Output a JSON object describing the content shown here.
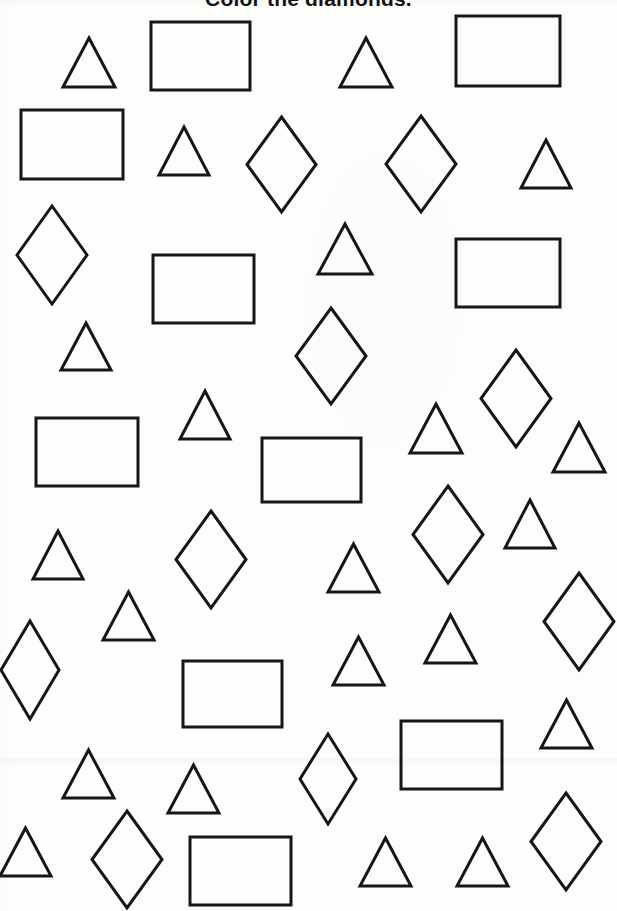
{
  "worksheet": {
    "title": "Color the diamonds.",
    "title_clipped_at_top": true,
    "instruction_target_shape": "diamond",
    "background_color": "#fdfdfc",
    "stroke_color": "#15161a",
    "page_width": 617,
    "page_height": 911,
    "counts": {
      "triangles": 25,
      "rectangles": 11,
      "diamonds": 16,
      "total": 52
    }
  },
  "shapes": [
    {
      "name": "triangle-1",
      "type": "triangle",
      "x": 63,
      "y": 38,
      "w": 52,
      "h": 49,
      "stroke": 3.0
    },
    {
      "name": "rectangle-1",
      "type": "rectangle",
      "x": 151,
      "y": 22,
      "w": 99,
      "h": 68,
      "stroke": 3.0
    },
    {
      "name": "triangle-2",
      "type": "triangle",
      "x": 340,
      "y": 38,
      "w": 52,
      "h": 49,
      "stroke": 3.0
    },
    {
      "name": "rectangle-2",
      "type": "rectangle",
      "x": 456,
      "y": 16,
      "w": 104,
      "h": 70,
      "stroke": 3.0
    },
    {
      "name": "rectangle-3",
      "type": "rectangle",
      "x": 21,
      "y": 110,
      "w": 102,
      "h": 69,
      "stroke": 3.0
    },
    {
      "name": "triangle-3",
      "type": "triangle",
      "x": 159,
      "y": 127,
      "w": 50,
      "h": 48,
      "stroke": 3.0
    },
    {
      "name": "diamond-1",
      "type": "diamond",
      "x": 247,
      "y": 117,
      "w": 69,
      "h": 95,
      "stroke": 3.0
    },
    {
      "name": "diamond-2",
      "type": "diamond",
      "x": 386,
      "y": 116,
      "w": 70,
      "h": 96,
      "stroke": 3.0
    },
    {
      "name": "triangle-4",
      "type": "triangle",
      "x": 521,
      "y": 140,
      "w": 50,
      "h": 48,
      "stroke": 3.0
    },
    {
      "name": "diamond-3",
      "type": "diamond",
      "x": 17,
      "y": 206,
      "w": 70,
      "h": 98,
      "stroke": 3.0
    },
    {
      "name": "triangle-5",
      "type": "triangle",
      "x": 318,
      "y": 224,
      "w": 54,
      "h": 50,
      "stroke": 3.0
    },
    {
      "name": "rectangle-4",
      "type": "rectangle",
      "x": 153,
      "y": 255,
      "w": 101,
      "h": 68,
      "stroke": 3.0
    },
    {
      "name": "rectangle-5",
      "type": "rectangle",
      "x": 456,
      "y": 239,
      "w": 104,
      "h": 68,
      "stroke": 3.0
    },
    {
      "name": "triangle-6",
      "type": "triangle",
      "x": 61,
      "y": 323,
      "w": 50,
      "h": 47,
      "stroke": 3.0
    },
    {
      "name": "diamond-4",
      "type": "diamond",
      "x": 296,
      "y": 308,
      "w": 70,
      "h": 96,
      "stroke": 3.0
    },
    {
      "name": "diamond-5",
      "type": "diamond",
      "x": 481,
      "y": 350,
      "w": 70,
      "h": 97,
      "stroke": 3.0
    },
    {
      "name": "triangle-7",
      "type": "triangle",
      "x": 180,
      "y": 391,
      "w": 50,
      "h": 48,
      "stroke": 3.0
    },
    {
      "name": "triangle-8",
      "type": "triangle",
      "x": 410,
      "y": 404,
      "w": 52,
      "h": 49,
      "stroke": 3.0
    },
    {
      "name": "rectangle-6",
      "type": "rectangle",
      "x": 36,
      "y": 418,
      "w": 102,
      "h": 68,
      "stroke": 3.0
    },
    {
      "name": "triangle-9",
      "type": "triangle",
      "x": 553,
      "y": 423,
      "w": 52,
      "h": 49,
      "stroke": 3.0
    },
    {
      "name": "rectangle-7",
      "type": "rectangle",
      "x": 262,
      "y": 438,
      "w": 99,
      "h": 64,
      "stroke": 3.0
    },
    {
      "name": "diamond-6",
      "type": "diamond",
      "x": 176,
      "y": 511,
      "w": 70,
      "h": 97,
      "stroke": 3.0
    },
    {
      "name": "diamond-7",
      "type": "diamond",
      "x": 413,
      "y": 486,
      "w": 70,
      "h": 97,
      "stroke": 3.0
    },
    {
      "name": "triangle-10",
      "type": "triangle",
      "x": 505,
      "y": 500,
      "w": 50,
      "h": 48,
      "stroke": 3.0
    },
    {
      "name": "triangle-11",
      "type": "triangle",
      "x": 33,
      "y": 531,
      "w": 50,
      "h": 48,
      "stroke": 3.0
    },
    {
      "name": "triangle-12",
      "type": "triangle",
      "x": 328,
      "y": 544,
      "w": 51,
      "h": 48,
      "stroke": 3.0
    },
    {
      "name": "diamond-8",
      "type": "diamond",
      "x": 544,
      "y": 573,
      "w": 70,
      "h": 97,
      "stroke": 3.0
    },
    {
      "name": "triangle-13",
      "type": "triangle",
      "x": 103,
      "y": 592,
      "w": 51,
      "h": 48,
      "stroke": 3.0
    },
    {
      "name": "triangle-14",
      "type": "triangle",
      "x": 425,
      "y": 615,
      "w": 51,
      "h": 48,
      "stroke": 3.0
    },
    {
      "name": "diamond-9",
      "type": "diamond",
      "x": 1,
      "y": 621,
      "w": 58,
      "h": 98,
      "stroke": 3.0
    },
    {
      "name": "triangle-15",
      "type": "triangle",
      "x": 333,
      "y": 637,
      "w": 51,
      "h": 48,
      "stroke": 3.0
    },
    {
      "name": "rectangle-8",
      "type": "rectangle",
      "x": 183,
      "y": 661,
      "w": 99,
      "h": 66,
      "stroke": 3.0
    },
    {
      "name": "triangle-16",
      "type": "triangle",
      "x": 541,
      "y": 700,
      "w": 51,
      "h": 48,
      "stroke": 3.0
    },
    {
      "name": "rectangle-9",
      "type": "rectangle",
      "x": 401,
      "y": 721,
      "w": 101,
      "h": 68,
      "stroke": 3.0
    },
    {
      "name": "triangle-17",
      "type": "triangle",
      "x": 63,
      "y": 750,
      "w": 51,
      "h": 48,
      "stroke": 3.0
    },
    {
      "name": "diamond-10",
      "type": "diamond",
      "x": 300,
      "y": 734,
      "w": 56,
      "h": 90,
      "stroke": 3.0
    },
    {
      "name": "triangle-18",
      "type": "triangle",
      "x": 168,
      "y": 765,
      "w": 51,
      "h": 48,
      "stroke": 3.0
    },
    {
      "name": "diamond-11",
      "type": "diamond",
      "x": 531,
      "y": 793,
      "w": 70,
      "h": 97,
      "stroke": 3.0
    },
    {
      "name": "triangle-19",
      "type": "triangle",
      "x": 0,
      "y": 828,
      "w": 51,
      "h": 48,
      "stroke": 3.0
    },
    {
      "name": "diamond-12",
      "type": "diamond",
      "x": 92,
      "y": 811,
      "w": 70,
      "h": 97,
      "stroke": 3.0
    },
    {
      "name": "rectangle-10",
      "type": "rectangle",
      "x": 190,
      "y": 837,
      "w": 101,
      "h": 68,
      "stroke": 3.0
    },
    {
      "name": "triangle-20",
      "type": "triangle",
      "x": 360,
      "y": 838,
      "w": 51,
      "h": 48,
      "stroke": 3.0
    },
    {
      "name": "triangle-21",
      "type": "triangle",
      "x": 457,
      "y": 838,
      "w": 51,
      "h": 48,
      "stroke": 3.0
    }
  ]
}
